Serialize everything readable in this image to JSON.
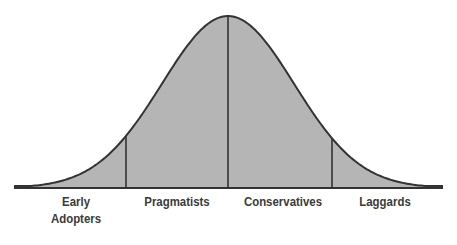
{
  "chart_data": {
    "type": "area",
    "title": "",
    "curve": "normal distribution (bell curve)",
    "segments": [
      {
        "label": "Early Adopters",
        "line1": "Early",
        "line2": "Adopters",
        "x_start": 15,
        "x_end": 126
      },
      {
        "label": "Pragmatists",
        "x_start": 126,
        "x_end": 228
      },
      {
        "label": "Conservatives",
        "x_start": 228,
        "x_end": 332
      },
      {
        "label": "Laggards",
        "x_start": 332,
        "x_end": 442
      }
    ],
    "dividers_x": [
      126,
      228,
      332
    ],
    "xlabel": "",
    "ylabel": "",
    "grid": false,
    "legend": "none",
    "colors": {
      "fill": "#b5b5b5",
      "stroke": "#333333",
      "text": "#3a3a3a"
    }
  }
}
